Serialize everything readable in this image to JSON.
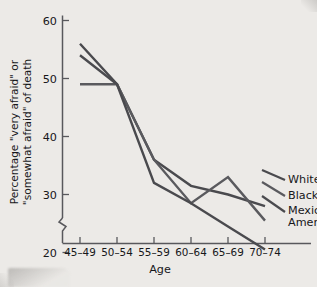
{
  "chart_data": {
    "type": "line",
    "title": "",
    "xlabel": "Age",
    "ylabel": "Percentage \"very afraid\" or \"somewhat afraid\" of death",
    "ylabel_line1": "Percentage \"very afraid\" or",
    "ylabel_line2": "\"somewhat afraid\" of death",
    "categories": [
      "45–49",
      "50–54",
      "55–59",
      "60–64",
      "65–69",
      "70–74"
    ],
    "ylim": [
      15,
      60
    ],
    "yticks": [
      20,
      30,
      40,
      50,
      60
    ],
    "ytick_labels": [
      "20",
      "30",
      "40",
      "50",
      "60"
    ],
    "axis_break": true,
    "grid": false,
    "legend_position": "right-inline",
    "series": [
      {
        "name": "Whites",
        "color": "#4a4a4e",
        "values": [
          56,
          49,
          36,
          31.5,
          30,
          28
        ]
      },
      {
        "name": "Blacks",
        "color": "#5a5a5e",
        "values": [
          49,
          49,
          36,
          28.5,
          33,
          25.5
        ]
      },
      {
        "name": "Mexican Americans",
        "color": "#4a4a4e",
        "values": [
          54,
          49,
          32,
          28.5,
          24.5,
          20.5
        ]
      }
    ]
  },
  "legend": {
    "entries": [
      {
        "label": "Whites"
      },
      {
        "label": "Blacks"
      },
      {
        "label": "Mexican"
      },
      {
        "label": "Americans"
      }
    ]
  }
}
